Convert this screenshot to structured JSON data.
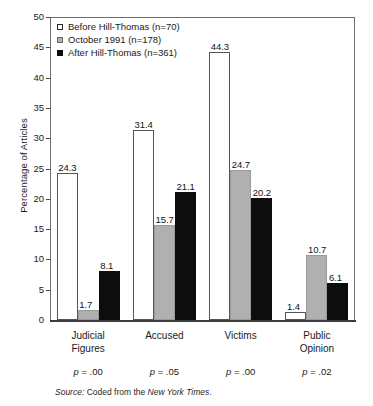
{
  "chart_data": {
    "type": "bar",
    "title": "",
    "subtitle": "",
    "xlabel": "",
    "ylabel": "Percentage of Articles",
    "ylim": [
      0,
      50
    ],
    "ytick_interval": 5,
    "yticks": [
      "50",
      "45",
      "40",
      "35",
      "30",
      "25",
      "20",
      "15",
      "10",
      "5",
      "0"
    ],
    "grid": false,
    "legend_position": "top-left",
    "categories": [
      "Judicial Figures",
      "Accused",
      "Victims",
      "Public Opinion"
    ],
    "category_lines": [
      [
        "Judicial",
        "Figures"
      ],
      [
        "Accused"
      ],
      [
        "Victims"
      ],
      [
        "Public",
        "Opinion"
      ]
    ],
    "series": [
      {
        "name": "Before Hill-Thomas (n=70)",
        "short_name": "Before Hill-Thomas",
        "n": 70,
        "style": "white",
        "color": "#ffffff",
        "values": [
          24.3,
          31.4,
          44.3,
          1.4
        ],
        "labels": [
          "24.3",
          "31.4",
          "44.3",
          "1.4"
        ]
      },
      {
        "name": "October 1991 (n=178)",
        "short_name": "October 1991",
        "n": 178,
        "style": "gray",
        "color": "#b0b0b0",
        "values": [
          1.7,
          15.7,
          24.7,
          10.7
        ],
        "labels": [
          "1.7",
          "15.7",
          "24.7",
          "10.7"
        ]
      },
      {
        "name": "After Hill-Thomas (n=361)",
        "short_name": "After Hill-Thomas",
        "n": 361,
        "style": "black",
        "color": "#0d0d0d",
        "values": [
          8.1,
          21.1,
          20.2,
          6.1
        ],
        "labels": [
          "8.1",
          "21.1",
          "20.2",
          "6.1"
        ]
      }
    ],
    "annotations": {
      "p_values": [
        "p = .00",
        "p = .05",
        "p = .00",
        "p = .02"
      ],
      "p_symbol": "p",
      "p_values_rest": [
        " = .00",
        " = .05",
        " = .00",
        " = .02"
      ]
    }
  },
  "legend": {
    "items": [
      {
        "label": "Before Hill-Thomas (n=70)",
        "swatch": "white-square-swatch"
      },
      {
        "label": "October 1991 (n=178)",
        "swatch": "gray-square-swatch"
      },
      {
        "label": "After Hill-Thomas (n=361)",
        "swatch": "black-square-swatch"
      }
    ]
  },
  "source": {
    "lead": "Source:",
    "body": " Coded from the ",
    "publication": "New York Times",
    "trailing": "."
  },
  "colors": {
    "series_white": "#ffffff",
    "series_gray": "#b0b0b0",
    "series_black": "#0d0d0d",
    "axis": "#3d3d3d",
    "frame": "#6e6e6e",
    "text": "#1a1a1a"
  }
}
